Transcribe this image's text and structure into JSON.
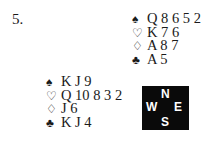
{
  "problem_number": "5.",
  "north": {
    "spades": {
      "symbol": "♠",
      "cards": "Q 8 6 5 2"
    },
    "hearts": {
      "symbol": "♡",
      "cards": "K 7 6"
    },
    "diamonds": {
      "symbol": "♢",
      "cards": "A 8 7"
    },
    "clubs": {
      "symbol": "♣",
      "cards": "A 5"
    }
  },
  "west": {
    "spades": {
      "symbol": "♠",
      "cards": "K J 9"
    },
    "hearts": {
      "symbol": "♡",
      "cards": "Q 10 8 3 2"
    },
    "diamonds": {
      "symbol": "♢",
      "cards": "J 6"
    },
    "clubs": {
      "symbol": "♣",
      "cards": "K J 4"
    }
  },
  "compass": {
    "n": "N",
    "w": "W",
    "e": "E",
    "s": "S"
  }
}
